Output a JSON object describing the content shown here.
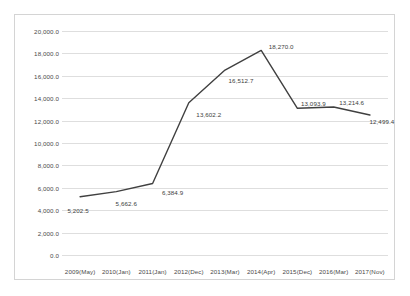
{
  "chart_data": {
    "type": "line",
    "title": "",
    "subtitle": "",
    "xlabel": "",
    "ylabel": "",
    "grid": true,
    "legend": "none",
    "ylim": [
      0,
      20000
    ],
    "y_ticks": [
      "0.0",
      "2,000.0",
      "4,000.0",
      "6,000.0",
      "8,000.0",
      "10,000.0",
      "12,000.0",
      "14,000.0",
      "16,000.0",
      "18,000.0",
      "20,000.0"
    ],
    "y_tick_values": [
      0,
      2000,
      4000,
      6000,
      8000,
      10000,
      12000,
      14000,
      16000,
      18000,
      20000
    ],
    "categories": [
      "2009(May)",
      "2010(Jan)",
      "2011(Jan)",
      "2012(Dec)",
      "2013(Mar)",
      "2014(Apr)",
      "2015(Dec)",
      "2016(Mar)",
      "2017(Nov)"
    ],
    "values": [
      5202.5,
      5662.6,
      6384.9,
      13602.2,
      16512.7,
      18270.0,
      13093.9,
      13214.6,
      12499.4
    ],
    "data_labels": [
      "5,202.5",
      "5,662.6",
      "6,384.9",
      "13,602.2",
      "16,512.7",
      "18,270.0",
      "13,093.9",
      "13,214.6",
      "12,499.4"
    ],
    "series": [
      {
        "name": "",
        "color": "#404040",
        "values": [
          5202.5,
          5662.6,
          6384.9,
          13602.2,
          16512.7,
          18270.0,
          13093.9,
          13214.6,
          12499.4
        ]
      }
    ],
    "colors": {
      "line": "#404040",
      "grid": "#dedede",
      "border": "#d4d4d4",
      "text": "#4a4a4a",
      "background": "#ffffff"
    }
  }
}
